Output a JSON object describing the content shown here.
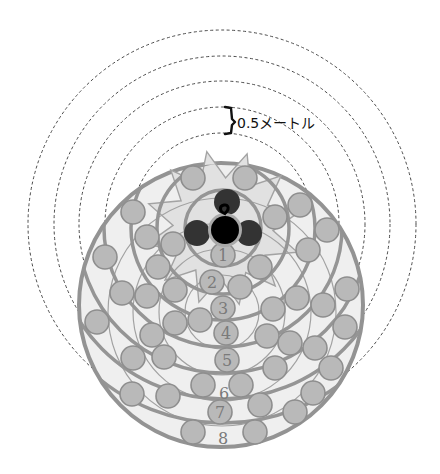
{
  "annotation": {
    "label": "0.5メートル",
    "bracket_top_y": 107,
    "bracket_bottom_y": 134
  },
  "colors": {
    "speaker": "#000000",
    "speaker_ring": "#a9a9a9",
    "companions": "#333333",
    "seat_fill": "#b9b9b9",
    "seat_stroke": "#8e8e8e",
    "disc_fill": "#efefef",
    "ring_stroke": "#959595",
    "dashed_ring": "#4a4a4a"
  },
  "distance_rings": {
    "center": [
      222,
      224
    ],
    "radii": [
      91,
      117,
      143,
      168,
      194
    ],
    "interval_label": "0.5メートル"
  },
  "seating_area": {
    "disc_center": [
      221,
      305
    ],
    "disc_radius": 142,
    "row_ring_center": [
      223,
      228
    ],
    "row_ring_radii": [
      38,
      66,
      92,
      119,
      145,
      171,
      195
    ],
    "thin_ring_center": [
      222,
      312
    ],
    "thin_ring_radii": [
      37,
      63,
      89,
      114
    ]
  },
  "center_group": {
    "speaker": {
      "cx": 225,
      "cy": 230,
      "r": 14
    },
    "companions": [
      {
        "cx": 227,
        "cy": 202,
        "r": 13
      },
      {
        "cx": 197,
        "cy": 233,
        "r": 13
      },
      {
        "cx": 249,
        "cy": 233,
        "r": 13
      }
    ]
  },
  "rows": [
    {
      "label": "1",
      "x": 223,
      "y": 261
    },
    {
      "label": "2",
      "x": 212,
      "y": 288
    },
    {
      "label": "3",
      "x": 223,
      "y": 314
    },
    {
      "label": "4",
      "x": 226,
      "y": 339
    },
    {
      "label": "5",
      "x": 227,
      "y": 366
    },
    {
      "label": "6",
      "x": 224,
      "y": 399
    },
    {
      "label": "7",
      "x": 220,
      "y": 418
    },
    {
      "label": "8",
      "x": 223,
      "y": 444
    }
  ],
  "numbered_seats": [
    [
      223,
      255
    ],
    [
      212,
      282
    ],
    [
      223,
      308
    ],
    [
      226,
      333
    ],
    [
      227,
      360
    ],
    [
      220,
      412
    ]
  ],
  "seats": [
    [
      193,
      178
    ],
    [
      245,
      178
    ],
    [
      133,
      212
    ],
    [
      300,
      205
    ],
    [
      275,
      217
    ],
    [
      147,
      237
    ],
    [
      173,
      244
    ],
    [
      327,
      230
    ],
    [
      308,
      250
    ],
    [
      105,
      257
    ],
    [
      158,
      267
    ],
    [
      260,
      267
    ],
    [
      240,
      287
    ],
    [
      175,
      290
    ],
    [
      122,
      293
    ],
    [
      147,
      296
    ],
    [
      347,
      289
    ],
    [
      297,
      298
    ],
    [
      323,
      305
    ],
    [
      97,
      322
    ],
    [
      152,
      335
    ],
    [
      175,
      323
    ],
    [
      200,
      320
    ],
    [
      273,
      309
    ],
    [
      345,
      327
    ],
    [
      267,
      336
    ],
    [
      290,
      343
    ],
    [
      315,
      348
    ],
    [
      331,
      368
    ],
    [
      275,
      368
    ],
    [
      133,
      358
    ],
    [
      164,
      357
    ],
    [
      203,
      385
    ],
    [
      241,
      385
    ],
    [
      132,
      394
    ],
    [
      168,
      396
    ],
    [
      260,
      405
    ],
    [
      313,
      393
    ],
    [
      295,
      412
    ],
    [
      193,
      432
    ],
    [
      255,
      432
    ]
  ]
}
